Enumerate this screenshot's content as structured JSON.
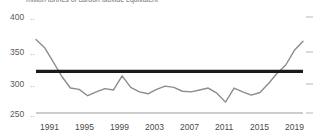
{
  "title": "million tonnes of carbon dioxide equivalent",
  "chart_data": {
    "type": "line",
    "title": "million tonnes of carbon dioxide equivalent",
    "xlabel": "",
    "ylabel": "",
    "xlim": [
      1990,
      2021
    ],
    "ylim": [
      250,
      400
    ],
    "grid": false,
    "legend": false,
    "yticks": [
      250,
      300,
      350,
      400
    ],
    "ytick_labels": [
      "250",
      "300",
      "350",
      "400"
    ],
    "xticks": [
      1991,
      1995,
      1999,
      2003,
      2007,
      2011,
      2015,
      2019
    ],
    "xtick_labels": [
      "1991",
      "1995",
      "1999",
      "2003",
      "2007",
      "2011",
      "2015",
      "2019"
    ],
    "x": [
      1990,
      1991,
      1992,
      1993,
      1994,
      1995,
      1996,
      1997,
      1998,
      1999,
      2000,
      2001,
      2002,
      2003,
      2004,
      2005,
      2006,
      2007,
      2008,
      2009,
      2010,
      2011,
      2012,
      2013,
      2014,
      2015,
      2016,
      2017,
      2018,
      2019,
      2020,
      2021
    ],
    "series": [
      {
        "name": "emissions",
        "color": "#8c8c8c",
        "width": 1.4,
        "values": [
          365,
          352,
          330,
          307,
          289,
          287,
          277,
          283,
          288,
          286,
          308,
          290,
          283,
          280,
          287,
          292,
          290,
          284,
          283,
          286,
          289,
          281,
          267,
          289,
          283,
          278,
          282,
          296,
          312,
          325,
          348,
          362
        ]
      }
    ],
    "reference_line": {
      "name": "target-line",
      "value": 315,
      "color": "#1a1a1a",
      "width": 3.2,
      "x_start": 1990,
      "x_end": 2021
    },
    "axis_color": "#aaaaaa",
    "right_ticks": [
      250,
      300,
      350,
      400
    ]
  }
}
